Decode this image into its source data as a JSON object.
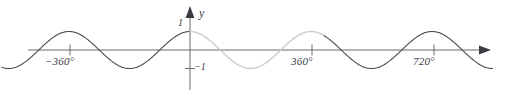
{
  "chart_data": {
    "type": "line",
    "title": "",
    "subtitle": "",
    "xlabel": "",
    "ylabel": "y",
    "function": "y = cos(x)",
    "x_unit": "degrees",
    "xlim": [
      -560,
      900
    ],
    "ylim": [
      -1.45,
      1.45
    ],
    "grid": false,
    "legend": null,
    "axes": {
      "x_axis": {
        "label": "",
        "arrow_end": "right",
        "tick_labels": [
          "−360°",
          "360°",
          "720°"
        ],
        "tick_values": [
          -360,
          360,
          720
        ]
      },
      "y_axis": {
        "label": "y",
        "arrow_end": "up",
        "tick_labels": [
          "1",
          "−1"
        ],
        "tick_values": [
          1,
          -1
        ]
      }
    },
    "series": [
      {
        "name": "cosine-dark-left",
        "color": "#4a4a52",
        "x_range": [
          -560,
          0
        ],
        "description": "y = cos(x) for x from -560° to 0°"
      },
      {
        "name": "cosine-highlight",
        "color": "#c9c9cf",
        "x_range": [
          0,
          400
        ],
        "description": "y = cos(x) highlighted for one period, x from 0° to 400°"
      },
      {
        "name": "cosine-dark-right",
        "color": "#4a4a52",
        "x_range": [
          400,
          900
        ],
        "description": "y = cos(x) for x from 400° to 900°"
      }
    ],
    "key_points": {
      "maxima_x": [
        -720,
        -360,
        0,
        360,
        720
      ],
      "minima_x": [
        -540,
        -180,
        180,
        540,
        900
      ],
      "amplitude": 1,
      "period": 360
    },
    "colors": {
      "axis": "#6b6b73",
      "curve_dark": "#4a4a52",
      "curve_light": "#c9c9cf",
      "text": "#3b3b42",
      "background": "#ffffff"
    }
  },
  "labels": {
    "x_tick_neg360": "−360°",
    "x_tick_360": "360°",
    "x_tick_720": "720°",
    "y_tick_one": "1",
    "y_tick_negone": "−1",
    "y_axis_name": "y"
  }
}
